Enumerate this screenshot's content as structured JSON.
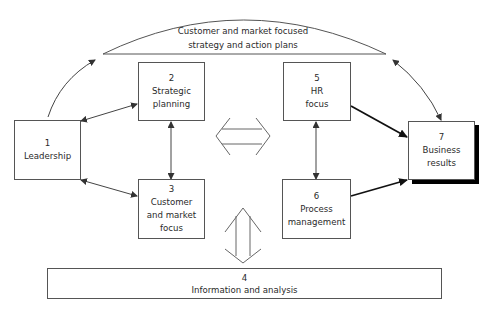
{
  "diagram": {
    "type": "framework-flow",
    "header": {
      "line1": "Customer and market focused",
      "line2": "strategy and action plans"
    },
    "boxes": [
      {
        "id": "1",
        "number": "1",
        "line1": "Leadership",
        "line2": ""
      },
      {
        "id": "2",
        "number": "2",
        "line1": "Strategic",
        "line2": "planning"
      },
      {
        "id": "3",
        "number": "3",
        "line1": "Customer",
        "line2": "and market",
        "line3": "focus"
      },
      {
        "id": "4",
        "number": "4",
        "line1": "Information and analysis"
      },
      {
        "id": "5",
        "number": "5",
        "line1": "HR",
        "line2": "focus"
      },
      {
        "id": "6",
        "number": "6",
        "line1": "Process",
        "line2": "management"
      },
      {
        "id": "7",
        "number": "7",
        "line1": "Business",
        "line2": "results"
      }
    ],
    "connections": [
      {
        "from": "1",
        "to": "2",
        "style": "double-headed"
      },
      {
        "from": "1",
        "to": "3",
        "style": "double-headed"
      },
      {
        "from": "2",
        "to": "3",
        "style": "double-headed"
      },
      {
        "from": "5",
        "to": "6",
        "style": "double-headed"
      },
      {
        "from": "5",
        "to": "7",
        "style": "bold-arrow"
      },
      {
        "from": "6",
        "to": "7",
        "style": "bold-arrow"
      },
      {
        "from": "1",
        "to": "header",
        "style": "curved-arrow"
      },
      {
        "from": "header",
        "to": "7",
        "style": "curved-double-headed"
      },
      {
        "from": "left-group",
        "to": "right-group",
        "style": "hollow-double-arrow"
      },
      {
        "from": "middle",
        "to": "4",
        "style": "hollow-double-arrow"
      }
    ],
    "colors": {
      "line": "#555555",
      "shadow": "#000000",
      "background": "#ffffff"
    }
  }
}
